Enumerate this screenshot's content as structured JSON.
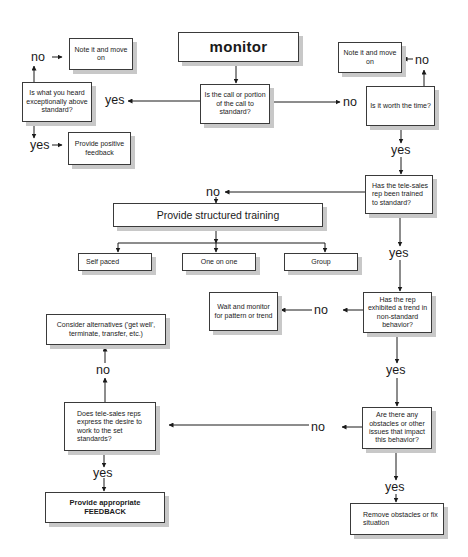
{
  "diagram": {
    "type": "flowchart",
    "start": {
      "label": "monitor"
    },
    "nodes": {
      "call_to_standard": "Is the call or portion of the call to standard?",
      "above_standard": "Is what you heard exceptionally above standard?",
      "note_left": "Note it and move on",
      "positive_feedback": "Provide positive feedback",
      "note_right": "Note it and move on",
      "worth_time": "Is it worth the time?",
      "trained": "Has the tele-sales rep been trained to standard?",
      "structured_training": "Provide structured training",
      "self_paced": "Self paced",
      "one_on_one": "One on one",
      "group": "Group",
      "trend": "Has the rep exhibited a trend in non-standard behavior?",
      "wait_monitor": "Wait and monitor for pattern or trend",
      "obstacles": "Are there any obstacles or other issues that impact this behavior?",
      "remove_obstacles": "Remove obstacles or fix situation",
      "desire": "Does tele-sales reps express the desire to work to the set standards?",
      "alternatives": "Consider alternatives ('get well', terminate, transfer, etc.)",
      "appropriate_feedback": "Provide appropriate FEEDBACK"
    },
    "edge_labels": {
      "yes": "yes",
      "no": "no"
    },
    "edges": [
      {
        "from": "monitor",
        "to": "call_to_standard",
        "label": ""
      },
      {
        "from": "call_to_standard",
        "to": "above_standard",
        "label": "yes"
      },
      {
        "from": "call_to_standard",
        "to": "worth_time",
        "label": "no"
      },
      {
        "from": "above_standard",
        "to": "note_left",
        "label": "no"
      },
      {
        "from": "above_standard",
        "to": "positive_feedback",
        "label": "yes"
      },
      {
        "from": "worth_time",
        "to": "note_right",
        "label": "no"
      },
      {
        "from": "worth_time",
        "to": "trained",
        "label": "yes"
      },
      {
        "from": "trained",
        "to": "structured_training",
        "label": "no"
      },
      {
        "from": "structured_training",
        "to": "self_paced",
        "label": ""
      },
      {
        "from": "structured_training",
        "to": "one_on_one",
        "label": ""
      },
      {
        "from": "structured_training",
        "to": "group",
        "label": ""
      },
      {
        "from": "trained",
        "to": "trend",
        "label": "yes"
      },
      {
        "from": "trend",
        "to": "wait_monitor",
        "label": "no"
      },
      {
        "from": "trend",
        "to": "obstacles",
        "label": "yes"
      },
      {
        "from": "obstacles",
        "to": "desire",
        "label": "no"
      },
      {
        "from": "obstacles",
        "to": "remove_obstacles",
        "label": "yes"
      },
      {
        "from": "desire",
        "to": "alternatives",
        "label": "no"
      },
      {
        "from": "desire",
        "to": "appropriate_feedback",
        "label": "yes"
      }
    ]
  }
}
